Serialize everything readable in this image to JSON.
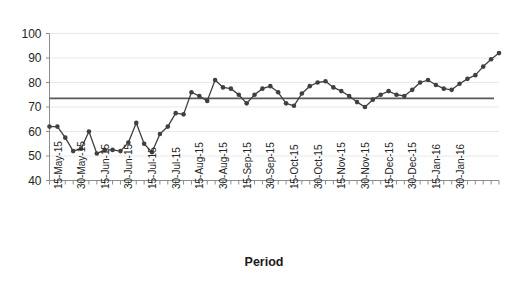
{
  "chart_data": {
    "type": "line",
    "title": "",
    "xlabel": "Period",
    "ylabel": "",
    "ylim": [
      40,
      100
    ],
    "ytick_values": [
      40,
      50,
      60,
      70,
      80,
      90,
      100
    ],
    "ytick_labels": [
      "40",
      "50",
      "60",
      "70",
      "80",
      "90",
      "100"
    ],
    "grid": "horizontal",
    "legend": "none",
    "marker": "filled-circle",
    "series_color": "#404040",
    "reference_line": {
      "label": "mean-reference-line",
      "value": 73.5,
      "color": "#595959",
      "orientation": "horizontal"
    },
    "xtick_labels": [
      "15-May-15",
      "30-May-15",
      "15-Jun-15",
      "30-Jun-15",
      "15-Jul-15",
      "30-Jul-15",
      "15-Aug-15",
      "30-Aug-15",
      "15-Sep-15",
      "30-Sep-15",
      "15-Oct-15",
      "30-Oct-15",
      "15-Nov-15",
      "30-Nov-15",
      "15-Dec-15",
      "30-Dec-15",
      "15-Jan-16",
      "30-Jan-16"
    ],
    "xtick_label_interval": 3,
    "x_indices": [
      0,
      1,
      2,
      3,
      4,
      5,
      6,
      7,
      8,
      9,
      10,
      11,
      12,
      13,
      14,
      15,
      16,
      17,
      18,
      19,
      20,
      21,
      22,
      23,
      24,
      25,
      26,
      27,
      28,
      29,
      30,
      31,
      32,
      33,
      34,
      35,
      36,
      37,
      38,
      39,
      40,
      41,
      42,
      43,
      44,
      45,
      46,
      47,
      48,
      49,
      50,
      51,
      52,
      53,
      54,
      55,
      56,
      57
    ],
    "values": [
      62.0,
      62.0,
      57.5,
      52.0,
      53.0,
      60.0,
      51.0,
      52.5,
      52.5,
      52.0,
      55.5,
      63.5,
      55.0,
      51.5,
      59.0,
      62.0,
      67.5,
      67.0,
      76.0,
      74.5,
      72.5,
      81.0,
      78.0,
      77.5,
      75.0,
      71.5,
      75.0,
      77.5,
      78.5,
      76.0,
      71.5,
      70.5,
      75.5,
      78.5,
      80.0,
      80.5,
      78.0,
      76.5,
      74.5,
      72.0,
      70.0,
      73.0,
      75.0,
      76.5,
      75.0,
      74.5,
      77.0,
      80.0,
      81.0,
      79.0,
      77.5,
      77.0,
      79.5,
      81.5,
      83.0,
      86.5,
      89.5,
      92.0
    ]
  },
  "axis": {
    "x_title": "Period"
  }
}
